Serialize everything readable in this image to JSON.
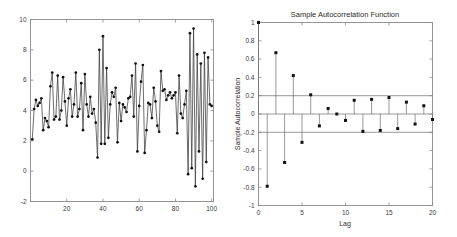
{
  "figure": {
    "background": "#ffffff",
    "axis_color": "#8a8a8a",
    "line_color": "#3b3b3b",
    "marker_color": "#111111"
  },
  "chart_data": [
    {
      "type": "line",
      "id": "time-series",
      "title": "",
      "xlabel": "",
      "ylabel": "",
      "xlim": [
        0,
        101
      ],
      "ylim": [
        -2,
        10
      ],
      "xticks": [
        20,
        40,
        60,
        80,
        100
      ],
      "xticklabels": [
        "20",
        "40",
        "60",
        "80",
        "100"
      ],
      "yticks": [
        -2,
        0,
        2,
        4,
        6,
        8,
        10
      ],
      "yticklabels": [
        "-2",
        "0",
        "2",
        "4",
        "6",
        "8",
        "10"
      ],
      "grid": false,
      "legend": null,
      "markers": "filled-circle",
      "x": [
        1,
        2,
        3,
        4,
        5,
        6,
        7,
        8,
        9,
        10,
        11,
        12,
        13,
        14,
        15,
        16,
        17,
        18,
        19,
        20,
        21,
        22,
        23,
        24,
        25,
        26,
        27,
        28,
        29,
        30,
        31,
        32,
        33,
        34,
        35,
        36,
        37,
        38,
        39,
        40,
        41,
        42,
        43,
        44,
        45,
        46,
        47,
        48,
        49,
        50,
        51,
        52,
        53,
        54,
        55,
        56,
        57,
        58,
        59,
        60,
        61,
        62,
        63,
        64,
        65,
        66,
        67,
        68,
        69,
        70,
        71,
        72,
        73,
        74,
        75,
        76,
        77,
        78,
        79,
        80,
        81,
        82,
        83,
        84,
        85,
        86,
        87,
        88,
        89,
        90,
        91,
        92,
        93,
        94,
        95,
        96,
        97,
        98,
        99,
        100
      ],
      "values": [
        2.1,
        4.1,
        4.7,
        4.3,
        4.5,
        4.8,
        2.7,
        3.5,
        3.3,
        2.9,
        5.6,
        6.5,
        3.4,
        3.6,
        6.3,
        3.4,
        4.0,
        6.2,
        4.6,
        3.0,
        4.8,
        5.4,
        3.6,
        4.4,
        6.5,
        3.6,
        4.1,
        5.8,
        2.7,
        6.4,
        4.4,
        3.6,
        4.9,
        3.8,
        4.1,
        3.2,
        0.9,
        8.0,
        1.8,
        8.9,
        1.8,
        6.8,
        2.2,
        4.4,
        5.2,
        4.9,
        5.5,
        1.9,
        4.5,
        3.3,
        4.4,
        4.2,
        3.9,
        4.8,
        4.9,
        6.3,
        3.6,
        7.1,
        1.3,
        4.3,
        5.9,
        7.0,
        1.2,
        2.7,
        4.5,
        4.4,
        3.5,
        5.5,
        4.6,
        3.0,
        2.6,
        6.6,
        5.3,
        5.4,
        4.7,
        5.0,
        5.2,
        4.8,
        5.0,
        5.2,
        2.5,
        6.3,
        3.8,
        3.5,
        4.4,
        5.3,
        -0.2,
        9.1,
        0.2,
        9.4,
        -1.0,
        7.7,
        1.3,
        7.1,
        -0.5,
        7.8,
        0.6,
        7.5,
        4.4,
        4.3
      ]
    },
    {
      "type": "bar",
      "id": "acf",
      "title": "Sample Autocorrelation Function",
      "xlabel": "Lag",
      "ylabel": "Sample Autocorrelation",
      "xlim": [
        0,
        20
      ],
      "ylim": [
        -1,
        1
      ],
      "xticks": [
        0,
        5,
        10,
        15,
        20
      ],
      "xticklabels": [
        "0",
        "5",
        "10",
        "15",
        "20"
      ],
      "yticks": [
        -1,
        -0.8,
        -0.6,
        -0.4,
        -0.2,
        0,
        0.2,
        0.4,
        0.6,
        0.8,
        1
      ],
      "yticklabels": [
        "-1",
        "-0.8",
        "-0.6",
        "-0.4",
        "-0.2",
        "0",
        "0.2",
        "0.4",
        "0.6",
        "0.8",
        "1"
      ],
      "grid": false,
      "legend": null,
      "markers": "filled-square-stem",
      "confidence_bounds": [
        0.2,
        -0.2
      ],
      "categories": [
        0,
        1,
        2,
        3,
        4,
        5,
        6,
        7,
        8,
        9,
        10,
        11,
        12,
        13,
        14,
        15,
        16,
        17,
        18,
        19,
        20
      ],
      "values": [
        1.0,
        -0.79,
        0.67,
        -0.53,
        0.42,
        -0.31,
        0.21,
        -0.13,
        0.06,
        0.0,
        -0.07,
        0.15,
        -0.19,
        0.16,
        -0.18,
        0.18,
        -0.16,
        0.13,
        -0.11,
        0.09,
        -0.06
      ]
    }
  ]
}
